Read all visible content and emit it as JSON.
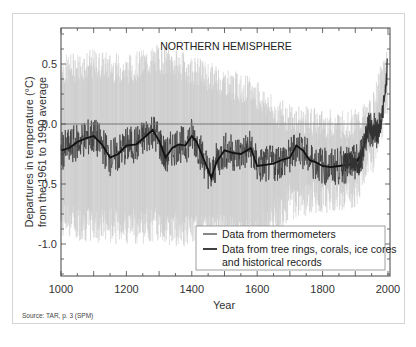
{
  "chart_data": {
    "type": "line",
    "title": "NORTHERN HEMISPHERE",
    "xlabel": "Year",
    "ylabel": "Departures in temperature (°C) from the 1961 to 1990 average",
    "ylabel_lines": [
      "Departures in temperature (°C)",
      "from the 1961 to 1990 average"
    ],
    "xlim": [
      1000,
      2005
    ],
    "ylim": [
      -1.27,
      0.8
    ],
    "x_ticks": [
      1000,
      1200,
      1400,
      1600,
      1800,
      2000
    ],
    "x_tick_labels": [
      "1000",
      "1200",
      "1400",
      "1600",
      "1800",
      "2000"
    ],
    "y_ticks": [
      0.5,
      0.0,
      -0.5,
      -1.0
    ],
    "y_tick_labels": [
      "0.5",
      "0.0",
      "-0.5",
      "-1.0"
    ],
    "reference_line": 0.0,
    "grid": false,
    "legend_position": "lower right",
    "legend": [
      "Data from thermometers",
      "Data from tree rings, corals, ice cores and historical records"
    ],
    "legend_lines": [
      [
        "Data from thermometers"
      ],
      [
        "Data from tree rings, corals, ice cores",
        "and historical records"
      ]
    ],
    "series": [
      {
        "name": "Data from tree rings, corals, ice cores and historical records (50-year smoothed)",
        "x": [
          1000,
          1025,
          1050,
          1075,
          1100,
          1125,
          1150,
          1175,
          1200,
          1230,
          1260,
          1280,
          1300,
          1320,
          1340,
          1360,
          1380,
          1400,
          1415,
          1430,
          1445,
          1460,
          1475,
          1490,
          1500,
          1525,
          1550,
          1580,
          1600,
          1625,
          1650,
          1675,
          1700,
          1720,
          1740,
          1760,
          1780,
          1800,
          1825,
          1850,
          1875,
          1900,
          1920
        ],
        "values": [
          -0.22,
          -0.2,
          -0.15,
          -0.12,
          -0.1,
          -0.17,
          -0.28,
          -0.25,
          -0.18,
          -0.17,
          -0.1,
          -0.05,
          -0.14,
          -0.28,
          -0.2,
          -0.17,
          -0.18,
          -0.1,
          -0.15,
          -0.25,
          -0.35,
          -0.45,
          -0.32,
          -0.26,
          -0.22,
          -0.24,
          -0.25,
          -0.2,
          -0.35,
          -0.34,
          -0.33,
          -0.3,
          -0.28,
          -0.18,
          -0.22,
          -0.3,
          -0.32,
          -0.35,
          -0.36,
          -0.35,
          -0.34,
          -0.33,
          -0.25
        ]
      },
      {
        "name": "Data from thermometers",
        "x": [
          1860,
          1880,
          1900,
          1910,
          1920,
          1930,
          1940,
          1950,
          1960,
          1970,
          1980,
          1990,
          1998
        ],
        "values": [
          -0.35,
          -0.3,
          -0.32,
          -0.38,
          -0.25,
          -0.12,
          0.0,
          -0.05,
          -0.05,
          -0.08,
          0.05,
          0.2,
          0.48
        ]
      },
      {
        "name": "Uncertainty range (grey band)",
        "x": [
          1000,
          1100,
          1200,
          1300,
          1400,
          1500,
          1600,
          1650,
          1700,
          1800,
          1900,
          1950,
          2000
        ],
        "upper": [
          0.45,
          0.5,
          0.45,
          0.55,
          0.45,
          0.35,
          0.25,
          0.1,
          0.05,
          0.0,
          0.0,
          0.1,
          0.6
        ],
        "lower": [
          -0.8,
          -0.85,
          -0.85,
          -0.85,
          -0.9,
          -0.9,
          -0.95,
          -0.8,
          -0.65,
          -0.6,
          -0.55,
          -0.3,
          0.2
        ]
      }
    ]
  },
  "source": "Source: TAR, p. 3 (SPM)",
  "colors": {
    "band": "#c8c8c8",
    "proxy_raw": "#3a3a3a",
    "smooth": "#111111",
    "thermometer": "#555555",
    "axis": "#444444",
    "reference_line": "#777777"
  }
}
